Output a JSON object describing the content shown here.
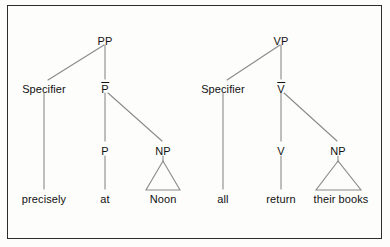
{
  "figure": {
    "kind": "syntax-tree-pair",
    "border_color": "#2c2c2c",
    "line_color": "#8a8a8a",
    "text_color": "#111111",
    "background": "#fdfdfc"
  },
  "trees": [
    {
      "id": "pp-tree",
      "root": {
        "label": "PP",
        "x": 105,
        "y": 41
      },
      "specifier": {
        "label": "Specifier",
        "x": 44,
        "y": 89
      },
      "bar": {
        "label": "P",
        "bar": true,
        "x": 105,
        "y": 89
      },
      "head": {
        "label": "P",
        "x": 105,
        "y": 151
      },
      "complement": {
        "label": "NP",
        "x": 163,
        "y": 151,
        "triangle": true
      },
      "leaves": [
        {
          "text": "precisely",
          "x": 44,
          "y": 199
        },
        {
          "text": "at",
          "x": 105,
          "y": 199
        },
        {
          "text": "Noon",
          "x": 163,
          "y": 199
        }
      ]
    },
    {
      "id": "vp-tree",
      "root": {
        "label": "VP",
        "x": 281,
        "y": 41
      },
      "specifier": {
        "label": "Specifier",
        "x": 223,
        "y": 89
      },
      "bar": {
        "label": "V",
        "bar": true,
        "x": 281,
        "y": 89
      },
      "head": {
        "label": "V",
        "x": 281,
        "y": 151
      },
      "complement": {
        "label": "NP",
        "x": 338,
        "y": 151,
        "triangle": true
      },
      "leaves": [
        {
          "text": "all",
          "x": 223,
          "y": 199
        },
        {
          "text": "return",
          "x": 281,
          "y": 199
        },
        {
          "text": "their books",
          "x": 341,
          "y": 199
        }
      ]
    }
  ]
}
